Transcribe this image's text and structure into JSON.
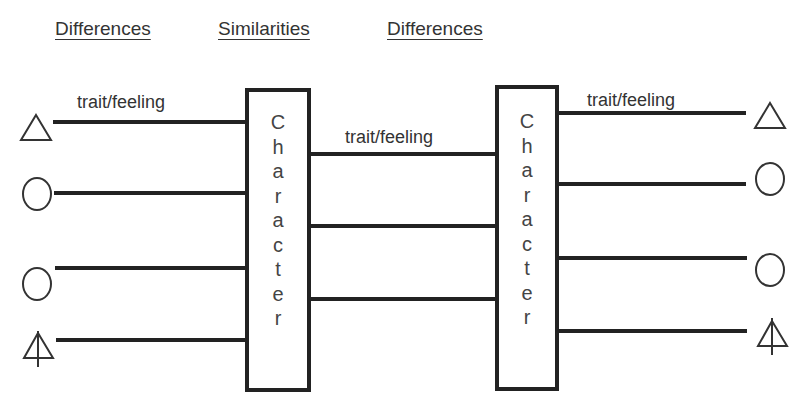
{
  "headings": {
    "left": "Differences",
    "middle": "Similarities",
    "right": "Differences"
  },
  "labels": {
    "left_trait": "trait/feeling",
    "middle_trait": "trait/feeling",
    "right_trait": "trait/feeling"
  },
  "boxes": {
    "left": {
      "label": "Character",
      "letters": [
        "C",
        "h",
        "a",
        "r",
        "a",
        "c",
        "t",
        "e",
        "r"
      ]
    },
    "right": {
      "label": "Character",
      "letters": [
        "C",
        "h",
        "a",
        "r",
        "a",
        "c",
        "t",
        "e",
        "r"
      ]
    }
  },
  "symbols": {
    "left": [
      "triangle-icon",
      "circle-icon",
      "circle-icon",
      "triangle-arrow-icon"
    ],
    "right": [
      "triangle-icon",
      "circle-icon",
      "circle-icon",
      "triangle-arrow-icon"
    ]
  },
  "colors": {
    "line": "#222222",
    "text": "#333333",
    "background": "#ffffff"
  }
}
